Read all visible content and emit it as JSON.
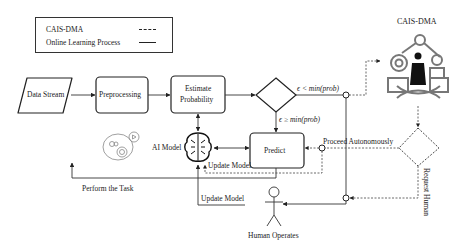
{
  "legend": {
    "items": [
      {
        "label": "CAIS-DMA",
        "line_style": "dashed"
      },
      {
        "label": "Online Learning Process",
        "line_style": "solid"
      }
    ]
  },
  "nodes": {
    "data_stream": "Data Stream",
    "preprocessing": "Preprocessing",
    "estimate_probability_line1": "Estimate",
    "estimate_probability_line2": "Probability",
    "predict": "Predict",
    "ai_model": "AI Model",
    "cais_dma": "CAIS-DMA",
    "human_operates": "Human Operates"
  },
  "edges": {
    "eps_less": "ϵ < min(prob)",
    "eps_geq": "ϵ ≥ min(prob)",
    "proceed_autonomously": "Proceed Autonomously",
    "request_human": "Request Human",
    "update_model_1": "Update Model",
    "update_model_2": "Update Model",
    "perform_task": "Perform the Task"
  },
  "icons": {
    "task": "gears-task-icon",
    "ai": "ai-brain-circuit-icon",
    "cais": "robot-arm-human-icon",
    "human": "stick-figure-icon"
  },
  "colors": {
    "line": "#333333",
    "icon_gray": "#7a7a7a",
    "icon_dark": "#1a1a1a"
  }
}
